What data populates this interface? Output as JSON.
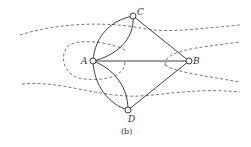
{
  "figure": {
    "caption": "(b)"
  },
  "nodes": [
    {
      "id": "A",
      "label": "A",
      "x": 93,
      "y": 61
    },
    {
      "id": "B",
      "label": "B",
      "x": 189,
      "y": 61
    },
    {
      "id": "C",
      "label": "C",
      "x": 133,
      "y": 16
    },
    {
      "id": "D",
      "label": "D",
      "x": 128,
      "y": 110
    }
  ],
  "edges": [
    {
      "from": "A",
      "to": "C",
      "kind": "curve-outer"
    },
    {
      "from": "A",
      "to": "C",
      "kind": "curve-inner"
    },
    {
      "from": "A",
      "to": "D",
      "kind": "curve-outer"
    },
    {
      "from": "A",
      "to": "D",
      "kind": "curve-inner"
    },
    {
      "from": "A",
      "to": "B",
      "kind": "straight"
    },
    {
      "from": "C",
      "to": "B",
      "kind": "straight"
    },
    {
      "from": "D",
      "to": "B",
      "kind": "straight"
    }
  ],
  "colors": {
    "line": "#2a2a2a",
    "river": "#555555",
    "background": "#ffffff"
  }
}
